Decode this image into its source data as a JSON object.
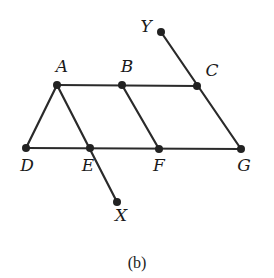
{
  "caption": "(b)",
  "points": {
    "A": {
      "label": "A",
      "x": 57,
      "y": 85,
      "lx": 62,
      "ly": 72
    },
    "B": {
      "label": "B",
      "x": 122,
      "y": 85,
      "lx": 127,
      "ly": 72
    },
    "C": {
      "label": "C",
      "x": 197,
      "y": 86,
      "lx": 212,
      "ly": 76
    },
    "D": {
      "label": "D",
      "x": 26,
      "y": 148,
      "lx": 27,
      "ly": 171
    },
    "E": {
      "label": "E",
      "x": 90,
      "y": 148,
      "lx": 88,
      "ly": 171
    },
    "F": {
      "label": "F",
      "x": 159,
      "y": 149,
      "lx": 159,
      "ly": 171
    },
    "G": {
      "label": "G",
      "x": 241,
      "y": 149,
      "lx": 244,
      "ly": 171
    },
    "X": {
      "label": "X",
      "x": 117,
      "y": 202,
      "lx": 121,
      "ly": 221
    },
    "Y": {
      "label": "Y",
      "x": 161,
      "y": 32,
      "lx": 146,
      "ly": 32
    }
  },
  "segments": [
    [
      "A",
      "C"
    ],
    [
      "D",
      "G"
    ],
    [
      "A",
      "D"
    ],
    [
      "A",
      "X"
    ],
    [
      "B",
      "F"
    ],
    [
      "Y",
      "G"
    ]
  ],
  "colors": {
    "line": "#2a2a2a",
    "point": "#222222",
    "background": "#ffffff"
  }
}
